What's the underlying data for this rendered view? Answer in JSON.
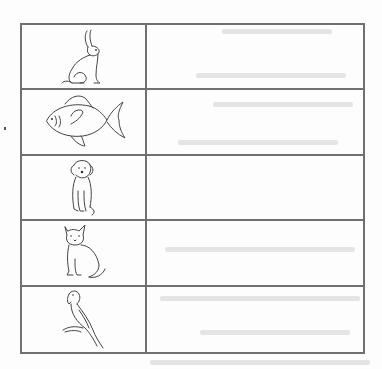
{
  "worksheet": {
    "type": "animal-labeling-table",
    "columns": 2,
    "line_color": "#707070",
    "rows": [
      {
        "animal": "rabbit",
        "icon": "rabbit-icon",
        "answer": ""
      },
      {
        "animal": "fish",
        "icon": "fish-icon",
        "answer": ""
      },
      {
        "animal": "dog",
        "icon": "dog-icon",
        "answer": ""
      },
      {
        "animal": "cat",
        "icon": "cat-icon",
        "answer": ""
      },
      {
        "animal": "parrot",
        "icon": "parrot-icon",
        "answer": ""
      }
    ]
  }
}
